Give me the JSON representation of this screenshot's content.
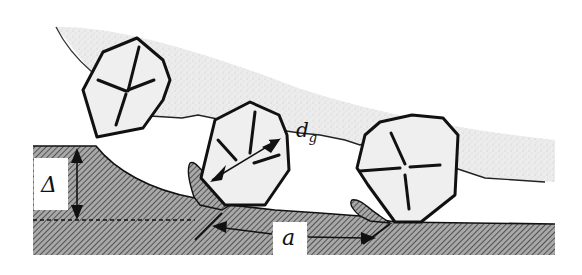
{
  "labels": {
    "depth_of_cut": "Δ",
    "grain_diameter": "d",
    "grain_diameter_subscript": "g",
    "grain_spacing": "a"
  },
  "elements": {
    "wheel_bond": "stippled bond region",
    "workpiece": "hatched workpiece",
    "grains": [
      "grain-1",
      "grain-2",
      "grain-3"
    ],
    "chips": [
      "chip-1",
      "chip-2"
    ]
  },
  "colors": {
    "ink": "#111111",
    "stipple": "#e6e6e6",
    "grain_fill": "#efefef",
    "hatch": "#555555",
    "background": "#ffffff"
  }
}
